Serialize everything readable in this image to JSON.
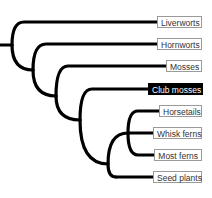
{
  "diagram": {
    "type": "cladogram",
    "colors": {
      "branch": "#000000",
      "highlight_bg": "#000000",
      "highlight_text": "#ffffff",
      "label_border": "#9a9a9a"
    },
    "taxa": [
      {
        "label": "Liverworts",
        "highlighted": false
      },
      {
        "label": "Hornworts",
        "highlighted": false
      },
      {
        "label": "Mosses",
        "highlighted": false
      },
      {
        "label": "Club mosses",
        "highlighted": true
      },
      {
        "label": "Horsetails",
        "highlighted": false
      },
      {
        "label": "Whisk ferns",
        "highlighted": false
      },
      {
        "label": "Most ferns",
        "highlighted": false
      },
      {
        "label": "Seed plants",
        "highlighted": false
      }
    ],
    "topology": "(Liverworts,(Hornworts,(Mosses,(Club mosses,((Horsetails,Whisk ferns,Most ferns),Seed plants)))))"
  }
}
